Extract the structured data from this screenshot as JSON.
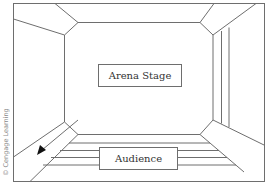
{
  "diagram": {
    "labels": {
      "stage": "Arena Stage",
      "audience": "Audience"
    },
    "credit": "© Cengage Learning",
    "colors": {
      "line": "#6e6e6e",
      "text": "#333333",
      "credit": "#8a8a8a",
      "background": "#ffffff"
    }
  }
}
